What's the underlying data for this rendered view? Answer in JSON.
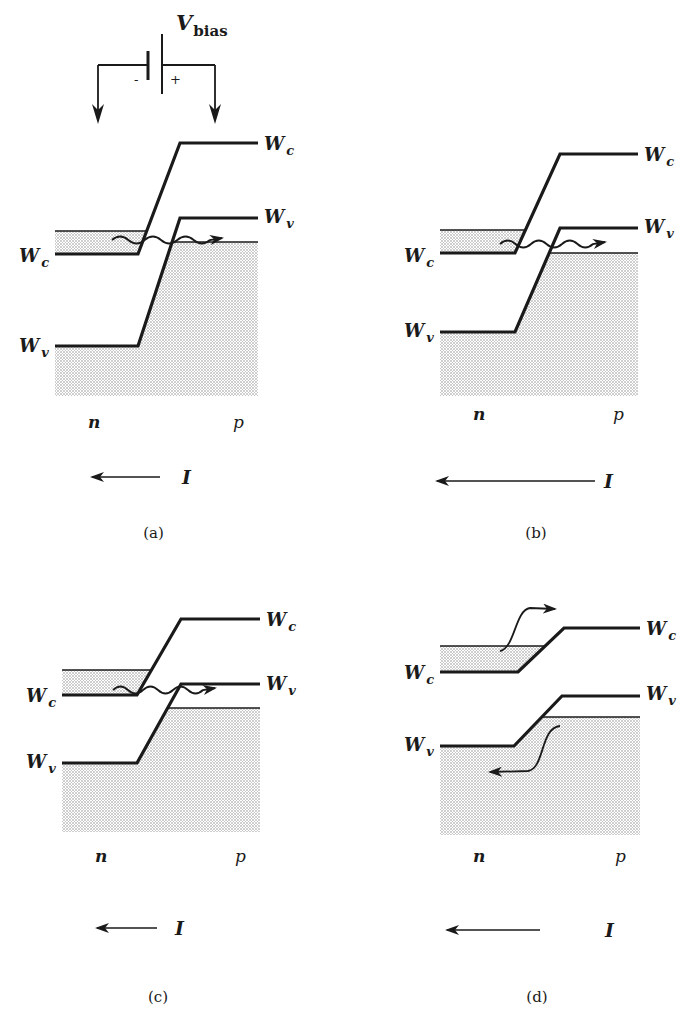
{
  "figure": {
    "bias_source": {
      "label_main": "V",
      "label_sub": "bias",
      "minus": "-",
      "plus": "+"
    },
    "colors": {
      "ink": "#1a1a1a",
      "shade": "#cfcfcf",
      "paper": "#ffffff"
    },
    "panels": [
      {
        "id": "a",
        "caption": "(a)",
        "n_label": "n",
        "p_label": "p",
        "current_label": "I",
        "band_labels": {
          "wc_left": "W",
          "wc_left_sub": "c",
          "wv_left": "W",
          "wv_left_sub": "v",
          "wc_right": "W",
          "wc_right_sub": "c",
          "wv_right": "W",
          "wv_right_sub": "v"
        },
        "geom": {
          "x0": 55,
          "k1": 138,
          "k2": 180,
          "x1": 258,
          "wc_n": 254,
          "wc_p": 143,
          "wv_n": 346,
          "wv_p": 218,
          "n_fill_top": 231,
          "p_fill_top": 242,
          "fill_bottom": 396,
          "shade_n_band": true,
          "arrow": {
            "x_from": 160,
            "x_to": 88,
            "y": 477,
            "label_x": 182
          },
          "caption_y": 538,
          "np_y": 428,
          "label_pos": {
            "wc_left_y": 262,
            "wv_left_y": 352,
            "wc_right_y": 150,
            "wv_right_y": 223
          }
        },
        "transition": "tunneling",
        "wave": {
          "x_from": 112,
          "x_to": 222,
          "y": 240
        }
      },
      {
        "id": "b",
        "caption": "(b)",
        "n_label": "n",
        "p_label": "p",
        "current_label": "I",
        "band_labels": {
          "wc_left": "W",
          "wc_left_sub": "c",
          "wv_left": "W",
          "wv_left_sub": "v",
          "wc_right": "W",
          "wc_right_sub": "c",
          "wv_right": "W",
          "wv_right_sub": "v"
        },
        "geom": {
          "x0": 440,
          "k1": 515,
          "k2": 560,
          "x1": 638,
          "wc_n": 253,
          "wc_p": 154,
          "wv_n": 332,
          "wv_p": 228,
          "n_fill_top": 230,
          "p_fill_top": 253,
          "fill_bottom": 396,
          "shade_n_band": true,
          "arrow": {
            "x_from": 595,
            "x_to": 433,
            "y": 481,
            "label_x": 604
          },
          "caption_y": 538,
          "np_y": 420,
          "label_pos": {
            "wc_left_y": 262,
            "wv_left_y": 337,
            "wc_right_y": 161,
            "wv_right_y": 233
          }
        },
        "transition": "tunneling",
        "wave": {
          "x_from": 500,
          "x_to": 605,
          "y": 244
        }
      },
      {
        "id": "c",
        "caption": "(c)",
        "n_label": "n",
        "p_label": "p",
        "current_label": "I",
        "band_labels": {
          "wc_left": "W",
          "wc_left_sub": "c",
          "wv_left": "W",
          "wv_left_sub": "v",
          "wc_right": "W",
          "wc_right_sub": "c",
          "wv_right": "W",
          "wv_right_sub": "v"
        },
        "geom": {
          "x0": 62,
          "k1": 137,
          "k2": 181,
          "x1": 260,
          "wc_n": 695,
          "wc_p": 619,
          "wv_n": 763,
          "wv_p": 684,
          "n_fill_top": 670,
          "p_fill_top": 708,
          "fill_bottom": 832,
          "shade_n_band": true,
          "arrow": {
            "x_from": 157,
            "x_to": 93,
            "y": 928,
            "label_x": 175
          },
          "caption_y": 1002,
          "np_y": 862,
          "label_pos": {
            "wc_left_y": 702,
            "wv_left_y": 768,
            "wc_right_y": 626,
            "wv_right_y": 690
          }
        },
        "transition": "tunneling",
        "wave": {
          "x_from": 113,
          "x_to": 215,
          "y": 690
        }
      },
      {
        "id": "d",
        "caption": "(d)",
        "n_label": "n",
        "p_label": "p",
        "current_label": "I",
        "band_labels": {
          "wc_left": "W",
          "wc_left_sub": "c",
          "wv_left": "W",
          "wv_left_sub": "v",
          "wc_right": "W",
          "wc_right_sub": "c",
          "wv_right": "W",
          "wv_right_sub": "v"
        },
        "geom": {
          "x0": 440,
          "k1": 518,
          "k2": 564,
          "x1": 640,
          "wc_n": 672,
          "wc_p": 628,
          "wv_n": 746,
          "wv_p": 696,
          "wv_k1": 514,
          "wv_k2": 562,
          "n_fill_top": 646,
          "p_fill_top": 717,
          "fill_bottom": 835,
          "shade_n_band": true,
          "arrow": {
            "x_from": 540,
            "x_to": 443,
            "y": 930,
            "label_x": 605
          },
          "caption_y": 1002,
          "np_y": 862,
          "label_pos": {
            "wc_left_y": 679,
            "wv_left_y": 751,
            "wc_right_y": 635,
            "wv_right_y": 700
          }
        },
        "transition": "diffusion"
      }
    ]
  }
}
